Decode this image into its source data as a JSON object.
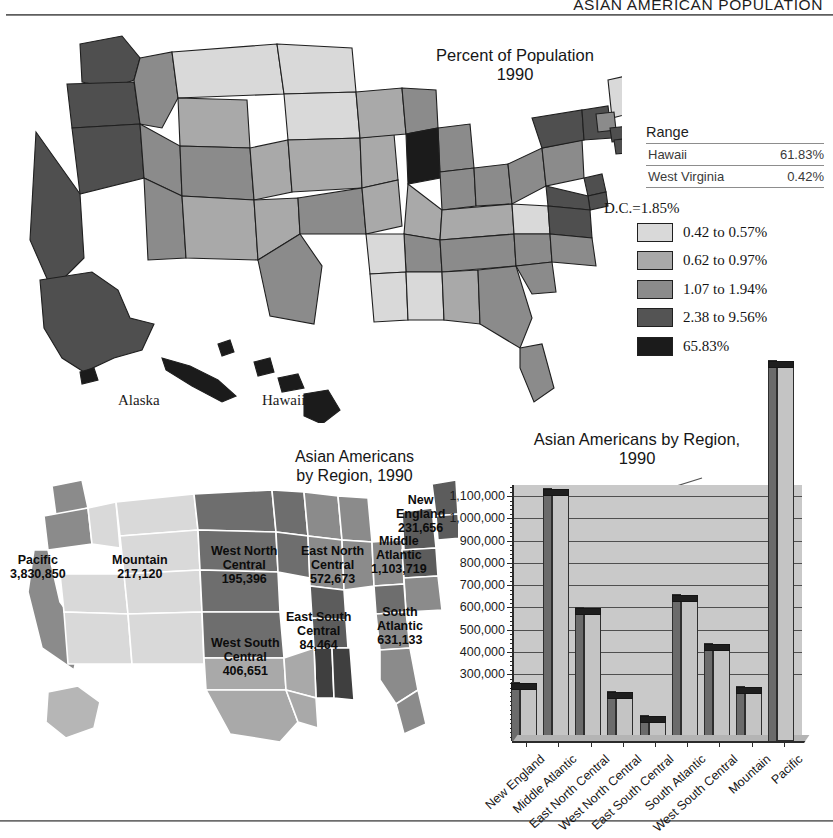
{
  "running_head": "ASIAN AMERICAN POPULATION",
  "main_map": {
    "title_line1": "Percent of Population",
    "title_line2": "1990",
    "inset_labels": {
      "alaska": "Alaska",
      "hawaii": "Hawaii"
    },
    "range_table": {
      "header": "Range",
      "rows": [
        {
          "name": "Hawaii",
          "value": "61.83%"
        },
        {
          "name": "West Virginia",
          "value": "0.42%"
        }
      ]
    },
    "dc_note": "D.C.=1.85%",
    "legend": [
      {
        "label": "0.42 to 0.57%",
        "color": "#d9d9d9"
      },
      {
        "label": "0.62 to 0.97%",
        "color": "#a9a9a9"
      },
      {
        "label": "1.07 to 1.94%",
        "color": "#8b8b8b"
      },
      {
        "label": "2.38 to 9.56%",
        "color": "#545454"
      },
      {
        "label": "65.83%",
        "color": "#1b1b1b"
      }
    ]
  },
  "region_map": {
    "title_line1": "Asian Americans",
    "title_line2": "by Region, 1990",
    "regions": [
      {
        "name": "Pacific",
        "value": "3,830,850"
      },
      {
        "name": "Mountain",
        "value": "217,120"
      },
      {
        "name": "West North\nCentral",
        "value": "195,396"
      },
      {
        "name": "East North\nCentral",
        "value": "572,673"
      },
      {
        "name": "New\nEngland",
        "value": "231,656"
      },
      {
        "name": "Middle\nAtlantic",
        "value": "1,103,719"
      },
      {
        "name": "South\nAtlantic",
        "value": "631,133"
      },
      {
        "name": "East South\nCentral",
        "value": "84,464"
      },
      {
        "name": "West South\nCentral",
        "value": "406,651"
      }
    ]
  },
  "chart_data": {
    "type": "bar",
    "title": "Asian Americans by Region,\n1990",
    "title_line1": "Asian Americans by Region,",
    "title_line2": "1990",
    "xlabel": "",
    "ylabel": "",
    "ylim": [
      0,
      1150000
    ],
    "grid": true,
    "legend": "none",
    "categories": [
      "New England",
      "Middle Atlantic",
      "East North Central",
      "West North Central",
      "East South Central",
      "South Atlantic",
      "West South Central",
      "Mountain",
      "Pacific"
    ],
    "values": [
      231656,
      1103719,
      572673,
      195396,
      84464,
      631133,
      406651,
      217120,
      3830850
    ],
    "value_labels": [
      "231,656",
      "1,103,719",
      "572,673",
      "195,396",
      "84,464",
      "631,133",
      "406,651",
      "217,120",
      "3,830,850"
    ],
    "yticks": [
      300000,
      400000,
      500000,
      600000,
      700000,
      800000,
      900000,
      1000000,
      1100000
    ],
    "ytick_labels": [
      "300,000",
      "400,000",
      "500,000",
      "600,000",
      "700,000",
      "800,000",
      "900,000",
      "1,000,000",
      "1,100,000"
    ],
    "annotations": [
      {
        "text": "3,830,850",
        "target": "Pacific",
        "note": "bar exceeds axis maximum"
      }
    ]
  }
}
